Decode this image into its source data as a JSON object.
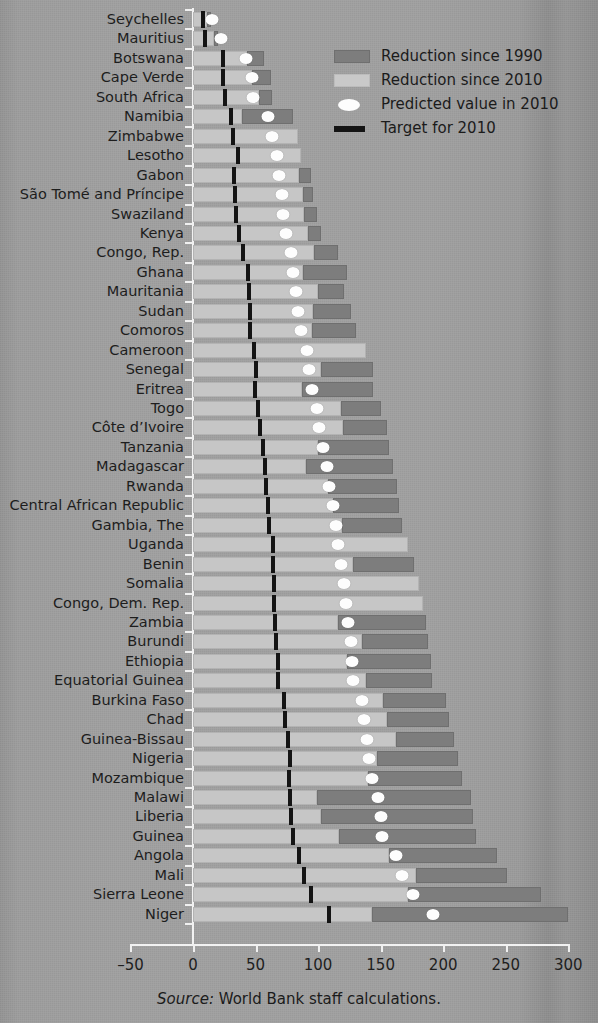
{
  "figure": {
    "source_prefix": "Source:",
    "source_text": " World Bank staff calculations."
  },
  "legend": {
    "items": [
      {
        "key": "reduction-1990",
        "label": "Reduction since 1990",
        "swatch": "dark-gray-square",
        "color": "#7d7d7d"
      },
      {
        "key": "reduction-2010",
        "label": "Reduction since 2010",
        "swatch": "light-gray-square",
        "color": "#c9c9c9"
      },
      {
        "key": "predicted-2010",
        "label": "Predicted value in 2010",
        "swatch": "white-ellipse",
        "color": "#fdfdfd"
      },
      {
        "key": "target-2010",
        "label": "Target for 2010",
        "swatch": "black-bar",
        "color": "#141414"
      }
    ]
  },
  "axis": {
    "x_ticks": [
      "–50",
      "0",
      "50",
      "100",
      "150",
      "200",
      "250",
      "300"
    ],
    "x_tick_values": [
      -50,
      0,
      50,
      100,
      150,
      200,
      250,
      300
    ],
    "xlim": [
      -50,
      300
    ]
  },
  "chart_data": {
    "type": "bar",
    "orientation": "horizontal",
    "title": "",
    "xlabel": "",
    "ylabel": "",
    "xlim": [
      -50,
      300
    ],
    "grid": false,
    "legend_position": "top-right",
    "stacked": true,
    "series": [
      {
        "name": "Reduction since 2010",
        "color": "#c9c9c9"
      },
      {
        "name": "Reduction since 1990",
        "color": "#7d7d7d"
      }
    ],
    "markers": [
      {
        "name": "Predicted value in 2010",
        "style": "white-ellipse"
      },
      {
        "name": "Target for 2010",
        "style": "black-tick"
      }
    ],
    "categories": [
      "Seychelles",
      "Mauritius",
      "Botswana",
      "Cape Verde",
      "South Africa",
      "Namibia",
      "Zimbabwe",
      "Lesotho",
      "Gabon",
      "São Tomé and Príncipe",
      "Swaziland",
      "Kenya",
      "Congo, Rep.",
      "Ghana",
      "Mauritania",
      "Sudan",
      "Comoros",
      "Cameroon",
      "Senegal",
      "Eritrea",
      "Togo",
      "Côte d’Ivoire",
      "Tanzania",
      "Madagascar",
      "Rwanda",
      "Central African Republic",
      "Gambia, The",
      "Uganda",
      "Benin",
      "Somalia",
      "Congo, Dem. Rep.",
      "Zambia",
      "Burundi",
      "Ethiopia",
      "Equatorial Guinea",
      "Burkina Faso",
      "Chad",
      "Guinea-Bissau",
      "Nigeria",
      "Mozambique",
      "Malawi",
      "Liberia",
      "Guinea",
      "Angola",
      "Mali",
      "Sierra Leone",
      "Niger"
    ],
    "rows": [
      {
        "country": "Seychelles",
        "reduction_2010_end": 11,
        "reduction_1990_end": 14,
        "predicted_2010": 15,
        "target_2010": 6
      },
      {
        "country": "Mauritius",
        "reduction_2010_end": 17,
        "reduction_1990_end": 20,
        "predicted_2010": 22,
        "target_2010": 8
      },
      {
        "country": "Botswana",
        "reduction_2010_end": 43,
        "reduction_1990_end": 57,
        "predicted_2010": 42,
        "target_2010": 22
      },
      {
        "country": "Cape Verde",
        "reduction_2010_end": 47,
        "reduction_1990_end": 62,
        "predicted_2010": 47,
        "target_2010": 22
      },
      {
        "country": "South Africa",
        "reduction_2010_end": 53,
        "reduction_1990_end": 63,
        "predicted_2010": 48,
        "target_2010": 24
      },
      {
        "country": "Namibia",
        "reduction_2010_end": 39,
        "reduction_1990_end": 80,
        "predicted_2010": 60,
        "target_2010": 29
      },
      {
        "country": "Zimbabwe",
        "reduction_2010_end": 84,
        "reduction_1990_end": 84,
        "predicted_2010": 63,
        "target_2010": 30
      },
      {
        "country": "Lesotho",
        "reduction_2010_end": 86,
        "reduction_1990_end": 86,
        "predicted_2010": 67,
        "target_2010": 34
      },
      {
        "country": "Gabon",
        "reduction_2010_end": 85,
        "reduction_1990_end": 94,
        "predicted_2010": 69,
        "target_2010": 31
      },
      {
        "country": "São Tomé and Príncipe",
        "reduction_2010_end": 88,
        "reduction_1990_end": 96,
        "predicted_2010": 71,
        "target_2010": 32
      },
      {
        "country": "Swaziland",
        "reduction_2010_end": 89,
        "reduction_1990_end": 99,
        "predicted_2010": 72,
        "target_2010": 33
      },
      {
        "country": "Kenya",
        "reduction_2010_end": 92,
        "reduction_1990_end": 102,
        "predicted_2010": 74,
        "target_2010": 35
      },
      {
        "country": "Congo, Rep.",
        "reduction_2010_end": 97,
        "reduction_1990_end": 116,
        "predicted_2010": 78,
        "target_2010": 38
      },
      {
        "country": "Ghana",
        "reduction_2010_end": 88,
        "reduction_1990_end": 123,
        "predicted_2010": 80,
        "target_2010": 42
      },
      {
        "country": "Mauritania",
        "reduction_2010_end": 100,
        "reduction_1990_end": 121,
        "predicted_2010": 82,
        "target_2010": 43
      },
      {
        "country": "Sudan",
        "reduction_2010_end": 96,
        "reduction_1990_end": 126,
        "predicted_2010": 84,
        "target_2010": 44
      },
      {
        "country": "Comoros",
        "reduction_2010_end": 95,
        "reduction_1990_end": 130,
        "predicted_2010": 86,
        "target_2010": 44
      },
      {
        "country": "Cameroon",
        "reduction_2010_end": 138,
        "reduction_1990_end": 138,
        "predicted_2010": 91,
        "target_2010": 47
      },
      {
        "country": "Senegal",
        "reduction_2010_end": 102,
        "reduction_1990_end": 144,
        "predicted_2010": 93,
        "target_2010": 49
      },
      {
        "country": "Eritrea",
        "reduction_2010_end": 87,
        "reduction_1990_end": 144,
        "predicted_2010": 95,
        "target_2010": 48
      },
      {
        "country": "Togo",
        "reduction_2010_end": 118,
        "reduction_1990_end": 150,
        "predicted_2010": 99,
        "target_2010": 50
      },
      {
        "country": "Côte d’Ivoire",
        "reduction_2010_end": 120,
        "reduction_1990_end": 155,
        "predicted_2010": 101,
        "target_2010": 52
      },
      {
        "country": "Tanzania",
        "reduction_2010_end": 100,
        "reduction_1990_end": 157,
        "predicted_2010": 104,
        "target_2010": 54
      },
      {
        "country": "Madagascar",
        "reduction_2010_end": 90,
        "reduction_1990_end": 160,
        "predicted_2010": 107,
        "target_2010": 56
      },
      {
        "country": "Rwanda",
        "reduction_2010_end": 108,
        "reduction_1990_end": 163,
        "predicted_2010": 109,
        "target_2010": 57
      },
      {
        "country": "Central African Republic",
        "reduction_2010_end": 112,
        "reduction_1990_end": 165,
        "predicted_2010": 112,
        "target_2010": 58
      },
      {
        "country": "Gambia, The",
        "reduction_2010_end": 119,
        "reduction_1990_end": 167,
        "predicted_2010": 114,
        "target_2010": 59
      },
      {
        "country": "Uganda",
        "reduction_2010_end": 172,
        "reduction_1990_end": 172,
        "predicted_2010": 116,
        "target_2010": 62
      },
      {
        "country": "Benin",
        "reduction_2010_end": 128,
        "reduction_1990_end": 177,
        "predicted_2010": 118,
        "target_2010": 62
      },
      {
        "country": "Somalia",
        "reduction_2010_end": 181,
        "reduction_1990_end": 181,
        "predicted_2010": 121,
        "target_2010": 63
      },
      {
        "country": "Congo, Dem. Rep.",
        "reduction_2010_end": 184,
        "reduction_1990_end": 184,
        "predicted_2010": 122,
        "target_2010": 63
      },
      {
        "country": "Zambia",
        "reduction_2010_end": 116,
        "reduction_1990_end": 186,
        "predicted_2010": 124,
        "target_2010": 64
      },
      {
        "country": "Burundi",
        "reduction_2010_end": 135,
        "reduction_1990_end": 188,
        "predicted_2010": 126,
        "target_2010": 65
      },
      {
        "country": "Ethiopia",
        "reduction_2010_end": 123,
        "reduction_1990_end": 190,
        "predicted_2010": 127,
        "target_2010": 66
      },
      {
        "country": "Equatorial Guinea",
        "reduction_2010_end": 138,
        "reduction_1990_end": 191,
        "predicted_2010": 128,
        "target_2010": 66
      },
      {
        "country": "Burkina Faso",
        "reduction_2010_end": 152,
        "reduction_1990_end": 202,
        "predicted_2010": 135,
        "target_2010": 71
      },
      {
        "country": "Chad",
        "reduction_2010_end": 155,
        "reduction_1990_end": 205,
        "predicted_2010": 137,
        "target_2010": 72
      },
      {
        "country": "Guinea-Bissau",
        "reduction_2010_end": 162,
        "reduction_1990_end": 209,
        "predicted_2010": 139,
        "target_2010": 74
      },
      {
        "country": "Nigeria",
        "reduction_2010_end": 147,
        "reduction_1990_end": 212,
        "predicted_2010": 141,
        "target_2010": 76
      },
      {
        "country": "Mozambique",
        "reduction_2010_end": 140,
        "reduction_1990_end": 215,
        "predicted_2010": 143,
        "target_2010": 75
      },
      {
        "country": "Malawi",
        "reduction_2010_end": 99,
        "reduction_1990_end": 222,
        "predicted_2010": 148,
        "target_2010": 76
      },
      {
        "country": "Liberia",
        "reduction_2010_end": 102,
        "reduction_1990_end": 224,
        "predicted_2010": 150,
        "target_2010": 77
      },
      {
        "country": "Guinea",
        "reduction_2010_end": 117,
        "reduction_1990_end": 226,
        "predicted_2010": 151,
        "target_2010": 78
      },
      {
        "country": "Angola",
        "reduction_2010_end": 157,
        "reduction_1990_end": 243,
        "predicted_2010": 162,
        "target_2010": 83
      },
      {
        "country": "Mali",
        "reduction_2010_end": 178,
        "reduction_1990_end": 251,
        "predicted_2010": 167,
        "target_2010": 87
      },
      {
        "country": "Sierra Leone",
        "reduction_2010_end": 172,
        "reduction_1990_end": 278,
        "predicted_2010": 176,
        "target_2010": 93
      },
      {
        "country": "Niger",
        "reduction_2010_end": 143,
        "reduction_1990_end": 300,
        "predicted_2010": 192,
        "target_2010": 107
      }
    ]
  }
}
